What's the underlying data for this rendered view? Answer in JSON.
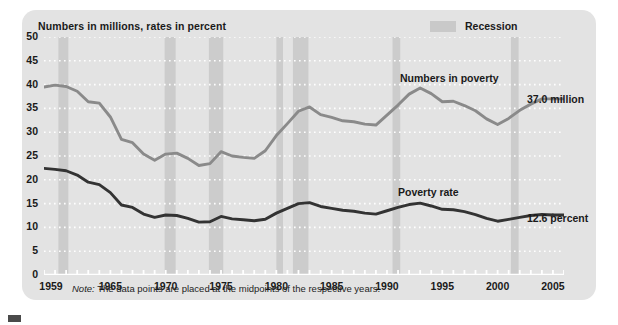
{
  "panel": {
    "header_label": "Numbers in millions, rates in percent",
    "legend": {
      "swatch_name": "recession-swatch",
      "label": "Recession",
      "color": "#c9c9c9"
    },
    "note_prefix": "Note:",
    "note_text": " The data points are placed at the midpoints of the respective years.",
    "annotations": {
      "numbers_in_poverty": "Numbers in poverty",
      "poverty_rate": "Poverty rate",
      "end_numbers": "37.0 million",
      "end_rate": "12.6 percent"
    }
  },
  "chart_data": {
    "type": "line",
    "title": "",
    "subtitle": "Numbers in millions, rates in percent",
    "xlabel": "",
    "ylabel": "",
    "xlim": [
      1959,
      2006
    ],
    "ylim": [
      0,
      50
    ],
    "ytick_step": 5,
    "yticks": [
      0,
      5,
      10,
      15,
      20,
      25,
      30,
      35,
      40,
      45,
      50
    ],
    "xticks_labeled": [
      1959,
      1965,
      1970,
      1975,
      1980,
      1985,
      1990,
      1995,
      2000,
      2005
    ],
    "xtick_minor_step": 1,
    "grid": "dotted-white-horizontal",
    "legend_position": "top-right",
    "series": [
      {
        "name": "Numbers in poverty",
        "units": "millions",
        "color": "#8a8a8a",
        "end_label": "37.0 million",
        "x": [
          1959,
          1960,
          1961,
          1962,
          1963,
          1964,
          1965,
          1966,
          1967,
          1968,
          1969,
          1970,
          1971,
          1972,
          1973,
          1974,
          1975,
          1976,
          1977,
          1978,
          1979,
          1980,
          1981,
          1982,
          1983,
          1984,
          1985,
          1986,
          1987,
          1988,
          1989,
          1990,
          1991,
          1992,
          1993,
          1994,
          1995,
          1996,
          1997,
          1998,
          1999,
          2000,
          2001,
          2002,
          2003,
          2004,
          2005
        ],
        "values": [
          39.5,
          39.9,
          39.6,
          38.6,
          36.4,
          36.1,
          33.2,
          28.5,
          27.8,
          25.4,
          24.1,
          25.4,
          25.6,
          24.5,
          23.0,
          23.4,
          25.9,
          25.0,
          24.7,
          24.5,
          26.1,
          29.3,
          31.8,
          34.4,
          35.3,
          33.7,
          33.1,
          32.4,
          32.2,
          31.7,
          31.5,
          33.6,
          35.7,
          38.0,
          39.3,
          38.1,
          36.4,
          36.5,
          35.6,
          34.5,
          32.8,
          31.6,
          32.9,
          34.6,
          35.9,
          37.0,
          37.0
        ]
      },
      {
        "name": "Poverty rate",
        "units": "percent",
        "color": "#333333",
        "end_label": "12.6 percent",
        "x": [
          1959,
          1960,
          1961,
          1962,
          1963,
          1964,
          1965,
          1966,
          1967,
          1968,
          1969,
          1970,
          1971,
          1972,
          1973,
          1974,
          1975,
          1976,
          1977,
          1978,
          1979,
          1980,
          1981,
          1982,
          1983,
          1984,
          1985,
          1986,
          1987,
          1988,
          1989,
          1990,
          1991,
          1992,
          1993,
          1994,
          1995,
          1996,
          1997,
          1998,
          1999,
          2000,
          2001,
          2002,
          2003,
          2004,
          2005
        ],
        "values": [
          22.4,
          22.2,
          21.9,
          21.0,
          19.5,
          19.0,
          17.3,
          14.7,
          14.2,
          12.8,
          12.1,
          12.6,
          12.5,
          11.9,
          11.1,
          11.2,
          12.3,
          11.8,
          11.6,
          11.4,
          11.7,
          13.0,
          14.0,
          15.0,
          15.2,
          14.4,
          14.0,
          13.6,
          13.4,
          13.0,
          12.8,
          13.5,
          14.2,
          14.8,
          15.1,
          14.5,
          13.8,
          13.7,
          13.3,
          12.7,
          11.9,
          11.3,
          11.7,
          12.1,
          12.5,
          12.7,
          12.6
        ]
      }
    ],
    "shaded_regions": {
      "name": "Recession",
      "color": "#cccccc",
      "spans": [
        [
          1960.3,
          1961.2
        ],
        [
          1969.9,
          1970.9
        ],
        [
          1973.9,
          1975.2
        ],
        [
          1980.0,
          1980.6
        ],
        [
          1981.5,
          1982.9
        ],
        [
          1990.5,
          1991.2
        ],
        [
          2001.2,
          2001.9
        ]
      ]
    }
  }
}
